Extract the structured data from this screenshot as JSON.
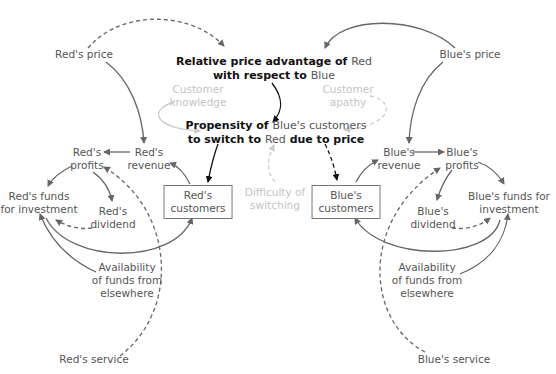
{
  "diagram": {
    "type": "causal-loop",
    "nodes": {
      "red_price": {
        "label": "Red's price"
      },
      "blue_price": {
        "label": "Blue's price"
      },
      "relative_advantage": {
        "line1_a": "Relative price advantage of ",
        "line1_b": "Red",
        "line2_a": "with respect to ",
        "line2_b": "Blue"
      },
      "customer_knowledge": {
        "line1": "Customer",
        "line2": "knowledge"
      },
      "customer_apathy": {
        "line1": "Customer",
        "line2": "apathy"
      },
      "propensity": {
        "line1_a": "Propensity of ",
        "line1_b": "Blue's customers",
        "line2_a": "to switch to ",
        "line2_b": "Red",
        "line2_c": " due to price"
      },
      "difficulty_switching": {
        "line1": "Difficulty of",
        "line2": "switching"
      },
      "red_profits": {
        "line1": "Red's",
        "line2": "profits"
      },
      "red_revenue": {
        "line1": "Red's",
        "line2": "revenue"
      },
      "red_funds": {
        "line1": "Red's funds",
        "line2": "for investment"
      },
      "red_dividend": {
        "line1": "Red's",
        "line2": "dividend"
      },
      "red_customers": {
        "line1": "Red's",
        "line2": "customers"
      },
      "red_availability": {
        "line1": "Availability",
        "line2": "of funds from",
        "line3": "elsewhere"
      },
      "red_service": {
        "label": "Red's service"
      },
      "blue_revenue": {
        "line1": "Blue's",
        "line2": "revenue"
      },
      "blue_profits": {
        "line1": "Blue's",
        "line2": "profits"
      },
      "blue_funds": {
        "line1": "Blue's funds for",
        "line2": "investment"
      },
      "blue_dividend": {
        "line1": "Blue's",
        "line2": "dividend"
      },
      "blue_customers": {
        "line1": "Blue's",
        "line2": "customers"
      },
      "blue_availability": {
        "line1": "Availability",
        "line2": "of funds from",
        "line3": "elsewhere"
      },
      "blue_service": {
        "label": "Blue's service"
      }
    },
    "colors": {
      "text": "#555555",
      "emphasis": "#111111",
      "faint": "#c4c4c4",
      "line": "#666666"
    }
  }
}
